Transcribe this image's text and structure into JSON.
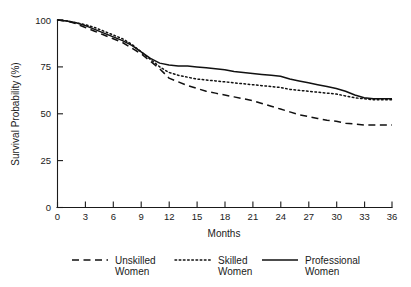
{
  "chart_data": {
    "type": "line",
    "title": "",
    "xlabel": "Months",
    "ylabel": "Survival Probability (%)",
    "xlim": [
      0,
      36
    ],
    "ylim": [
      0,
      100
    ],
    "xticks": [
      0,
      3,
      6,
      9,
      12,
      15,
      18,
      21,
      24,
      27,
      30,
      33,
      36
    ],
    "yticks": [
      0,
      25,
      50,
      75,
      100
    ],
    "xtick_labels": [
      "0",
      "3",
      "6",
      "9",
      "12",
      "15",
      "18",
      "21",
      "24",
      "27",
      "30",
      "33",
      "36"
    ],
    "ytick_labels": [
      "0",
      "25",
      "50",
      "75",
      "100"
    ],
    "grid": false,
    "legend_position": "below",
    "x": [
      0,
      1,
      2,
      3,
      4,
      5,
      6,
      7,
      8,
      9,
      10,
      11,
      12,
      13,
      14,
      15,
      16,
      17,
      18,
      19,
      20,
      21,
      22,
      23,
      24,
      25,
      26,
      27,
      28,
      29,
      30,
      31,
      32,
      33,
      34,
      35,
      36
    ],
    "series": [
      {
        "name": "Unskilled Women",
        "style": "dashed",
        "color": "#111111",
        "values": [
          100,
          99.5,
          98,
          96,
          94,
          92,
          90,
          88,
          85,
          82,
          78,
          74,
          69,
          67,
          65,
          63.5,
          62,
          61,
          60,
          59,
          58,
          57,
          55.5,
          54,
          52.5,
          51,
          49.5,
          48.5,
          47.5,
          46.5,
          46,
          45,
          44.5,
          44,
          44,
          44,
          44
        ]
      },
      {
        "name": "Skilled Women",
        "style": "dotted",
        "color": "#111111",
        "values": [
          100,
          99.5,
          98.5,
          97.5,
          96,
          94,
          92,
          90,
          87,
          83,
          79,
          75,
          72,
          70.5,
          69.5,
          68.5,
          68,
          67.5,
          67,
          66.5,
          66,
          65.5,
          65,
          64.5,
          64,
          63,
          62.5,
          62,
          61.5,
          61,
          60.5,
          59.5,
          58.5,
          58,
          57.5,
          57.5,
          57.5
        ]
      },
      {
        "name": "Professional Women",
        "style": "solid",
        "color": "#111111",
        "values": [
          100,
          99.5,
          98.5,
          97,
          95,
          93,
          91,
          89,
          86.5,
          83,
          79.5,
          77,
          76,
          75.5,
          75.5,
          75,
          74.5,
          74,
          73.5,
          72.5,
          72,
          71.5,
          71,
          70.5,
          70,
          68.5,
          67.5,
          66.5,
          65.5,
          64.5,
          63.5,
          62,
          60,
          58.5,
          58,
          58,
          58
        ]
      }
    ]
  },
  "legend": {
    "entries": [
      {
        "label_line1": "Unskilled",
        "label_line2": "Women",
        "style": "dashed"
      },
      {
        "label_line1": "Skilled",
        "label_line2": "Women",
        "style": "dotted"
      },
      {
        "label_line1": "Professional",
        "label_line2": "Women",
        "style": "solid"
      }
    ]
  }
}
